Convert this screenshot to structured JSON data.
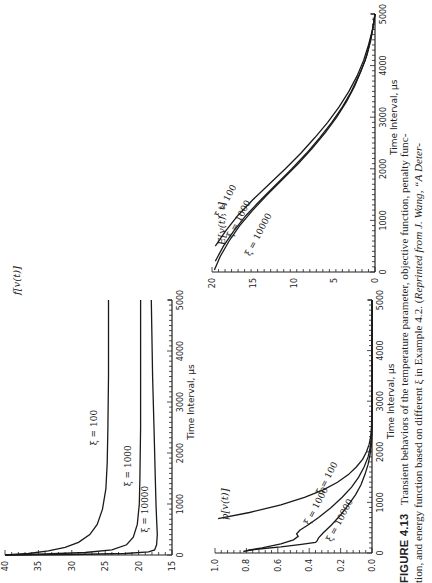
{
  "figure": {
    "label": "FIGURE 4.13",
    "caption_line1": "Transient behaviors of the temperature parameter, objective function, penalty func-",
    "caption_line2_a": "tion, and energy function based on different ξ in Example 4.2. (",
    "caption_line2_b": "Reprinted from J. Wang, “A Deter-"
  },
  "chart_data": [
    {
      "type": "line",
      "title": "",
      "ylabel": "f[v(t)]",
      "xlabel": "Time Interval, µs",
      "xlim": [
        0,
        5000
      ],
      "ylim": [
        15,
        40
      ],
      "xticks": [
        0,
        1000,
        2000,
        3000,
        4000,
        5000
      ],
      "yticks": [
        15,
        20,
        25,
        30,
        35,
        40
      ],
      "grid": false,
      "series": [
        {
          "name": "ξ = 100",
          "x": [
            0,
            30,
            80,
            150,
            250,
            400,
            600,
            900,
            1300,
            1800,
            2500,
            3500,
            5000
          ],
          "values": [
            40,
            36.5,
            33.5,
            31,
            29,
            27.3,
            26.2,
            25.4,
            24.9,
            24.7,
            24.6,
            24.5,
            24.5
          ]
        },
        {
          "name": "ξ = 1000",
          "x": [
            0,
            20,
            50,
            100,
            200,
            350,
            600,
            1000,
            1500,
            2500,
            3500,
            5000
          ],
          "values": [
            40,
            34,
            28,
            24,
            21.8,
            20.8,
            20.2,
            19.9,
            19.8,
            19.7,
            19.7,
            19.7
          ]
        },
        {
          "name": "ξ = 10000",
          "x": [
            0,
            10,
            30,
            60,
            100,
            200,
            400,
            700,
            1000,
            1500,
            2500,
            3500,
            5000
          ],
          "values": [
            40,
            30,
            22,
            18.5,
            17.6,
            17.3,
            17.2,
            17.3,
            17.4,
            17.5,
            17.7,
            17.9,
            18.1
          ]
        }
      ],
      "labels": [
        {
          "text": "ξ = 100",
          "x": 2500,
          "y": 26.2
        },
        {
          "text": "ξ = 1000",
          "x": 1750,
          "y": 21.1
        },
        {
          "text": "ξ = 10000",
          "x": 900,
          "y": 18.6
        }
      ]
    },
    {
      "type": "line",
      "title": "",
      "ylabel": "p[v(t)]",
      "xlabel": "Time Interval, µs",
      "xlim": [
        0,
        5000
      ],
      "ylim": [
        0,
        1.0
      ],
      "xticks": [
        0,
        1000,
        2000,
        3000,
        4000,
        5000
      ],
      "yticks": [
        0.0,
        0.2,
        0.4,
        0.6,
        0.8,
        1.0
      ],
      "grid": false,
      "series": [
        {
          "name": "ξ = 100",
          "x": [
            680,
            800,
            950,
            1100,
            1250,
            1400,
            1550,
            1700,
            1850,
            2000,
            2150,
            2300,
            2500,
            3000,
            5000
          ],
          "values": [
            0.98,
            0.78,
            0.58,
            0.43,
            0.31,
            0.22,
            0.15,
            0.1,
            0.06,
            0.035,
            0.018,
            0.008,
            0.003,
            0.0,
            0.0
          ]
        },
        {
          "name": "ξ = 1000",
          "x": [
            40,
            60,
            100,
            180,
            260,
            330,
            380,
            450,
            550,
            700,
            900,
            1100,
            1300,
            1500,
            1700,
            1900,
            2100,
            2300,
            2500,
            5000
          ],
          "values": [
            0.8,
            0.78,
            0.7,
            0.58,
            0.5,
            0.47,
            0.48,
            0.46,
            0.41,
            0.34,
            0.26,
            0.19,
            0.13,
            0.085,
            0.05,
            0.025,
            0.01,
            0.004,
            0.0,
            0.0
          ]
        },
        {
          "name": "ξ = 10000",
          "x": [
            30,
            50,
            80,
            120,
            170,
            210,
            240,
            300,
            400,
            550,
            750,
            950,
            1150,
            1350,
            1550,
            1750,
            1950,
            2150,
            2350,
            5000
          ],
          "values": [
            0.82,
            0.79,
            0.72,
            0.58,
            0.45,
            0.36,
            0.35,
            0.34,
            0.31,
            0.26,
            0.2,
            0.15,
            0.105,
            0.07,
            0.045,
            0.025,
            0.012,
            0.004,
            0.0,
            0.0
          ]
        }
      ],
      "labels": [
        {
          "text": "ξ = 100",
          "x": 1450,
          "y": 0.27
        },
        {
          "text": "ξ = 1000",
          "x": 900,
          "y": 0.34
        },
        {
          "text": "ξ = 10000",
          "x": 620,
          "y": 0.19
        }
      ]
    },
    {
      "type": "line",
      "title": "",
      "ylabel": "E[v(t), t]",
      "xlabel": "Time Interval, µs",
      "xlim": [
        0,
        5000
      ],
      "ylim": [
        0,
        20
      ],
      "xticks": [
        0,
        1000,
        2000,
        3000,
        4000,
        5000
      ],
      "yticks": [
        0,
        5,
        10,
        15,
        20
      ],
      "grid": false,
      "series": [
        {
          "name": "ξ = 100",
          "x": [
            500,
            800,
            1100,
            1400,
            1700,
            2000,
            2300,
            2600,
            2900,
            3200,
            3500,
            3800,
            4100,
            4400,
            4700,
            5000
          ],
          "values": [
            19.6,
            18.3,
            16.8,
            15.0,
            13.0,
            11.0,
            9.1,
            7.4,
            5.8,
            4.4,
            3.2,
            2.2,
            1.4,
            0.8,
            0.3,
            0.0
          ]
        },
        {
          "name": "ξ = 1000",
          "x": [
            210,
            500,
            800,
            1100,
            1400,
            1700,
            2000,
            2300,
            2600,
            2900,
            3200,
            3500,
            3800,
            4100,
            4400,
            4700,
            5000
          ],
          "values": [
            19.6,
            18.6,
            17.3,
            15.8,
            14.0,
            12.1,
            10.2,
            8.4,
            6.8,
            5.3,
            4.0,
            2.9,
            2.0,
            1.2,
            0.7,
            0.3,
            0.0
          ]
        },
        {
          "name": "ξ = 10000",
          "x": [
            40,
            300,
            600,
            900,
            1200,
            1500,
            1800,
            2100,
            2400,
            2700,
            3000,
            3300,
            3600,
            3900,
            4200,
            4500,
            4800,
            5000
          ],
          "values": [
            19.7,
            19.0,
            17.9,
            16.6,
            15.0,
            13.2,
            11.3,
            9.4,
            7.7,
            6.1,
            4.7,
            3.5,
            2.5,
            1.7,
            1.0,
            0.5,
            0.2,
            0.0
          ]
        }
      ],
      "labels": [
        {
          "text": "ξ = 100",
          "x": 1350,
          "y": 18.0
        },
        {
          "text": "ξ = 1000",
          "x": 1000,
          "y": 16.4
        },
        {
          "text": "ξ = 10000",
          "x": 700,
          "y": 14.0
        }
      ]
    }
  ],
  "layout": {
    "plots": [
      {
        "x_at_ymax": 5,
        "x_at_ymin": 172,
        "y_at_t0": 555,
        "y_at_tmax": 300,
        "ylabel_pos": [
          20,
          295
        ]
      },
      {
        "x_at_ymax": 215,
        "x_at_ymin": 372,
        "y_at_t0": 553,
        "y_at_tmax": 300,
        "ylabel_pos": [
          228,
          520
        ]
      },
      {
        "x_at_ymax": 212,
        "x_at_ymin": 375,
        "y_at_t0": 272,
        "y_at_tmax": 14,
        "ylabel_pos": [
          225,
          245
        ]
      }
    ]
  }
}
